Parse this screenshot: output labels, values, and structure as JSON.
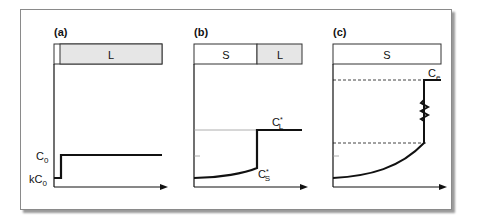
{
  "panels": [
    {
      "label": "(a)",
      "regions": [
        "",
        "L"
      ],
      "y_labels": [
        "C0",
        "kC0"
      ],
      "annotations": []
    },
    {
      "label": "(b)",
      "regions": [
        "S",
        "L"
      ],
      "y_labels": [],
      "annotations": [
        "C*L",
        "C*S"
      ]
    },
    {
      "label": "(c)",
      "regions": [
        "S"
      ],
      "y_labels": [],
      "annotations": [
        "Ce"
      ]
    }
  ],
  "text": {
    "a_label": "(a)",
    "b_label": "(b)",
    "c_label": "(c)",
    "a_L": "L",
    "b_S": "S",
    "b_L": "L",
    "c_S": "S",
    "C": "C",
    "sub0": "0",
    "k": "k",
    "sub_L": "L",
    "sub_S": "S",
    "sub_e": "e",
    "star": "*"
  },
  "colors": {
    "liquid_fill": "#e6e6e6",
    "line": "#111111",
    "frame": "#8a8a8a"
  }
}
